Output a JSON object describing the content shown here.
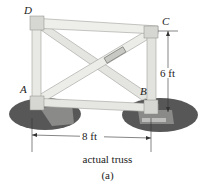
{
  "figure": {
    "joints": {
      "A": "A",
      "B": "B",
      "C": "C",
      "D": "D"
    },
    "dimensions": {
      "height": "6 ft",
      "width": "8 ft"
    },
    "caption": "actual truss",
    "sublabel": "(a)"
  },
  "colors": {
    "member": "#e6e6e2",
    "member_edge": "#9a9a96",
    "shadow": "#4a4a4a",
    "support": "#7a7a78"
  }
}
